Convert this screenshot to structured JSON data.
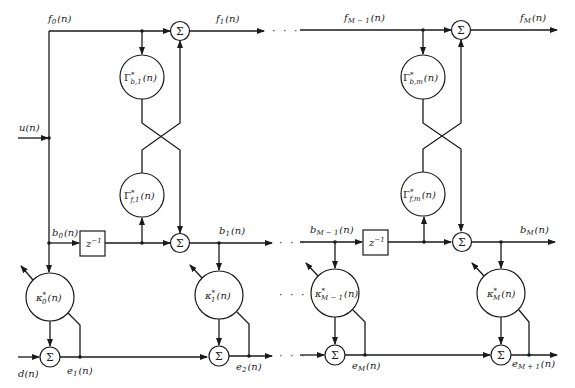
{
  "diagram": {
    "inputs": {
      "u": "u(n)",
      "d": "d(n)"
    },
    "forward_labels": [
      "f",
      "0",
      "(n)",
      "f",
      "1",
      "(n)",
      "f",
      "M − 1",
      "(n)",
      "f",
      "M",
      "(n)"
    ],
    "signals": {
      "f0": {
        "main": "f",
        "sub": "0",
        "arg": "(n)"
      },
      "f1": {
        "main": "f",
        "sub": "1",
        "arg": "(n)"
      },
      "fM1": {
        "main": "f",
        "sub": "M − 1",
        "arg": "(n)"
      },
      "fM": {
        "main": "f",
        "sub": "M",
        "arg": "(n)"
      },
      "b0": {
        "main": "b",
        "sub": "0",
        "arg": "(n)"
      },
      "b1": {
        "main": "b",
        "sub": "1",
        "arg": "(n)"
      },
      "bM1": {
        "main": "b",
        "sub": "M − 1",
        "arg": "(n)"
      },
      "bM": {
        "main": "b",
        "sub": "M",
        "arg": "(n)"
      },
      "e1": {
        "main": "e",
        "sub": "1",
        "arg": "(n)"
      },
      "e2": {
        "main": "e",
        "sub": "2",
        "arg": "(n)"
      },
      "eM": {
        "main": "e",
        "sub": "M",
        "arg": "(n)"
      },
      "eM1": {
        "main": "e",
        "sub": "M + 1",
        "arg": "(n)"
      }
    },
    "sum_symbol": "Σ",
    "delay": {
      "main": "z",
      "sup": "−1"
    },
    "reflection": {
      "gb1": {
        "main": "Γ",
        "sup": "*",
        "sub": "b,1",
        "arg": "(n)"
      },
      "gf1": {
        "main": "Γ",
        "sup": "*",
        "sub": "f,1",
        "arg": "(n)"
      },
      "gbm": {
        "main": "Γ",
        "sup": "*",
        "sub": "b,m",
        "arg": "(n)"
      },
      "gfm": {
        "main": "Γ",
        "sup": "*",
        "sub": "f,m",
        "arg": "(n)"
      }
    },
    "regression": {
      "k0": {
        "main": "κ",
        "sup": "*",
        "sub": "0",
        "arg": "(n)"
      },
      "k1": {
        "main": "κ",
        "sup": "*",
        "sub": "1",
        "arg": "(n)"
      },
      "kM1": {
        "main": "κ",
        "sup": "*",
        "sub": "M − 1",
        "arg": "(n)"
      },
      "kM": {
        "main": "κ",
        "sup": "*",
        "sub": "M",
        "arg": "(n)"
      }
    },
    "ellipsis": "· · ·"
  }
}
